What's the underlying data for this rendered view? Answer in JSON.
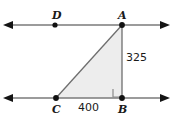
{
  "figure": {
    "type": "geometry-diagram",
    "background_color": "#ffffff",
    "line_color": "#7a7a7a",
    "triangle_fill": "#ededed",
    "triangle_stroke": "#6e6e6e",
    "label_color": "#1a1a1a",
    "points": [
      {
        "id": "D",
        "label": "D",
        "x": 55,
        "y": 25,
        "label_x": 52,
        "label_y": 19
      },
      {
        "id": "A",
        "label": "A",
        "x": 122,
        "y": 25,
        "label_x": 118,
        "label_y": 19
      },
      {
        "id": "C",
        "label": "C",
        "x": 56,
        "y": 98,
        "label_x": 52,
        "label_y": 113
      },
      {
        "id": "B",
        "label": "B",
        "x": 122,
        "y": 98,
        "label_x": 118,
        "label_y": 113
      }
    ],
    "lines": [
      {
        "id": "top-line",
        "name": "line-DA",
        "y": 25,
        "x_start": 4,
        "x_end": 169,
        "arrows": "both"
      },
      {
        "id": "bottom-line",
        "name": "line-CB",
        "y": 98,
        "x_start": 4,
        "x_end": 169,
        "arrows": "both"
      }
    ],
    "triangle": {
      "vertices": "C,A,B",
      "path": "M 56 98 L 122 25 L 122 98 Z"
    },
    "right_angle": {
      "at": "B",
      "x": 113,
      "y": 89,
      "size": 8
    },
    "measurements": [
      {
        "id": "AB",
        "value": "325",
        "segment": "A-B",
        "label_x": 126,
        "label_y": 61
      },
      {
        "id": "CB",
        "value": "400",
        "segment": "C-B",
        "label_x": 78,
        "label_y": 111
      }
    ]
  }
}
